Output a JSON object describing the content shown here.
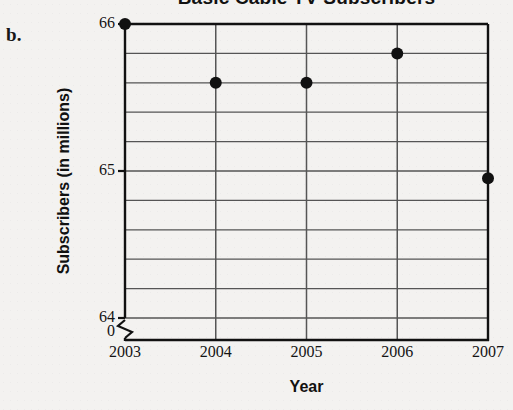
{
  "part_label": "b.",
  "chart_data": {
    "type": "scatter",
    "title": "Basic Cable TV Subscribers",
    "xlabel": "Year",
    "ylabel": "Subscribers (in millions)",
    "x": [
      2003,
      2004,
      2005,
      2006,
      2007
    ],
    "values": [
      66.0,
      65.6,
      65.6,
      65.8,
      64.95
    ],
    "categories": [
      "2003",
      "2004",
      "2005",
      "2006",
      "2007"
    ],
    "xtick_labels": [
      "2003",
      "2004",
      "2005",
      "2006",
      "2007"
    ],
    "ytick_labels": [
      "66",
      "65",
      "64",
      "0"
    ],
    "ylim": [
      64.0,
      66.0
    ],
    "xlim": [
      2003,
      2007
    ],
    "y_major_step": 1,
    "y_grid_step": 0.2,
    "grid": true,
    "axis_break": true,
    "axis_break_note": "zigzag break on y-axis between 64 and 0",
    "legend": "none",
    "marker": "filled-circle",
    "marker_color": "#111111",
    "grid_color": "#555555",
    "axis_color": "#111111",
    "background_color": "#f3f2f0"
  },
  "geometry": {
    "plot_left": 125,
    "plot_right": 488,
    "plot_top": 24,
    "plot_bottom": 318,
    "axis_baseline": 340,
    "gridline_count_y": 11,
    "gridline_count_x": 5
  }
}
